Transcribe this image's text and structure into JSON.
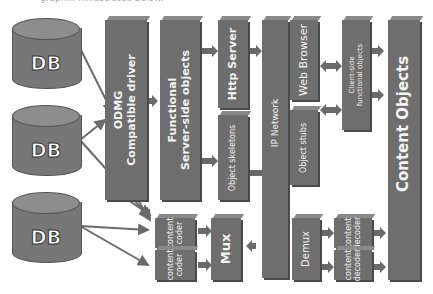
{
  "caption": "graph... ...illustrated below.",
  "databases": [
    {
      "label": "DB"
    },
    {
      "label": "DB"
    },
    {
      "label": "DB"
    }
  ],
  "blocks": {
    "odmg": "ODMG\nCompatible driver",
    "functional_server": "Functional\nServer-side objects",
    "http_server": "Http Server",
    "object_skeletons": "Object skeletons",
    "ip_network": "IP Network",
    "web_browser": "Web Browser",
    "object_stubs": "Object stubs",
    "client_side": "Client-side\nfunctional objects",
    "content_objects": "Content Objects",
    "content_coder_1": "content\ncoder",
    "content_coder_2": "content\ncoder",
    "mux": "Mux",
    "demux": "Demux",
    "content_decoder_1": "content\ndecoder",
    "content_decoder_2": "content\ndecoder"
  },
  "colors": {
    "block": "#6e6e6e",
    "arrow": "#6a6a6a",
    "text": "#f4f4f4"
  }
}
